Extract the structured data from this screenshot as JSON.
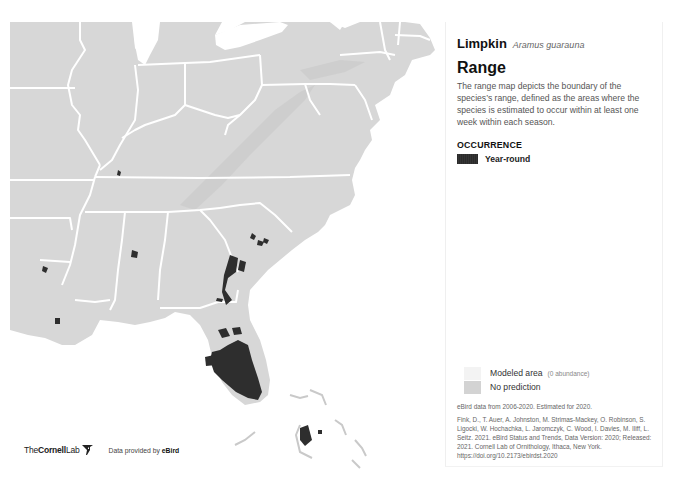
{
  "map": {
    "colors": {
      "land": "#d7d7d7",
      "state_lines": "#ffffff",
      "water": "#ffffff",
      "year_round": "#2e2e2e"
    }
  },
  "panel": {
    "common_name": "Limpkin",
    "scientific_name": "Aramus guarauna",
    "section_title": "Range",
    "description": "The range map depicts the boundary of the species’s range, defined as the areas where the species is estimated to occur within at least one week within each season.",
    "occurrence_title": "OCCURRENCE",
    "legend": [
      {
        "label": "Year-round",
        "color": "#2b2b2b"
      }
    ],
    "secondary_legend": [
      {
        "label": "Modeled area",
        "note": "(0 abundance)",
        "color": "#f3f3f3"
      },
      {
        "label": "No prediction",
        "note": "",
        "color": "#d3d3d3"
      }
    ],
    "data_note": "eBird data from 2006-2020. Estimated for 2020.",
    "citation": "Fink, D., T. Auer, A. Johnston, M. Strimas-Mackey, O. Robinson, S. Ligocki, W. Hochachka, L. Jaromczyk, C. Wood, I. Davies, M. Iliff, L. Seitz. 2021. eBird Status and Trends, Data Version: 2020; Released: 2021. Cornell Lab of Ornithology, Ithaca, New York. https://doi.org/10.2173/ebirdst.2020"
  },
  "footer": {
    "brand_prefix": "The",
    "brand_bold": "Cornell",
    "brand_suffix": "Lab",
    "provided_text": "Data provided by ",
    "provided_brand": "eBird"
  }
}
